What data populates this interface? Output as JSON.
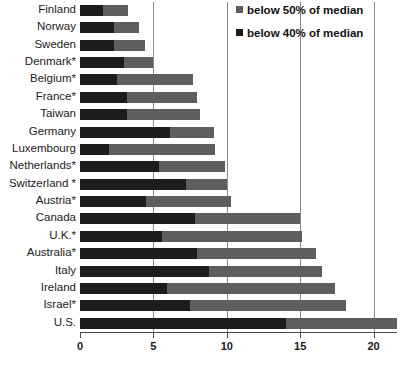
{
  "chart_data": {
    "type": "bar",
    "orientation": "horizontal",
    "stacked": true,
    "title": "",
    "xlabel": "",
    "ylabel": "",
    "xlim": [
      0,
      21.6
    ],
    "xticks": [
      0,
      5,
      10,
      15,
      20
    ],
    "xticklabels": [
      "0",
      "5",
      "10",
      "15",
      "20"
    ],
    "grid": "vertical",
    "legend_position": "top-right",
    "categories": [
      "Finland",
      "Norway",
      "Sweden",
      "Denmark*",
      "Belgium*",
      "France*",
      "Taiwan",
      "Germany",
      "Luxembourg",
      "Netherlands*",
      "Switzerland *",
      "Austria*",
      "Canada",
      "U.K.*",
      "Australia*",
      "Italy",
      "Ireland",
      "Israel*",
      "U.S."
    ],
    "series": [
      {
        "name": "below 40% of median",
        "color": "#1c1c1c",
        "values": [
          1.6,
          2.3,
          2.3,
          3.0,
          2.5,
          3.2,
          3.2,
          6.1,
          2.0,
          5.4,
          7.2,
          4.5,
          7.8,
          5.6,
          8.0,
          8.8,
          5.9,
          7.5,
          14.0
        ]
      },
      {
        "name": "below 50% of median",
        "color": "#5e5e5e",
        "values": [
          3.3,
          4.0,
          4.4,
          5.0,
          7.7,
          8.0,
          8.2,
          9.1,
          9.2,
          9.9,
          10.0,
          10.3,
          15.0,
          15.1,
          16.1,
          16.5,
          17.4,
          18.1,
          21.6
        ]
      }
    ],
    "legend": [
      {
        "label": "below 50% of median",
        "color": "#5e5e5e"
      },
      {
        "label": "below 40% of median",
        "color": "#1c1c1c"
      }
    ]
  }
}
